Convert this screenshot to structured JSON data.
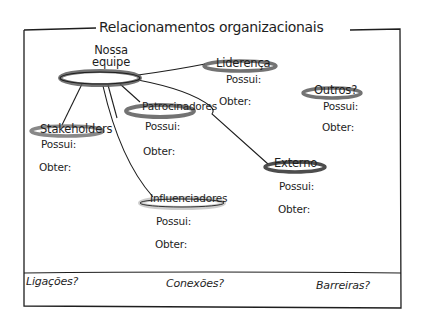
{
  "title": "Relacionamentos organizacionais",
  "center": {
    "label_line1": "Nossa",
    "label_line2": "equipe"
  },
  "nodes": [
    {
      "id": "lideranca",
      "label": "Liderença",
      "possui": "Possui:",
      "obter": "Obter:"
    },
    {
      "id": "outros",
      "label": "Outros?",
      "possui": "Possui:",
      "obter": "Obter:"
    },
    {
      "id": "patrocinadores",
      "label": "Patrocinadores",
      "possui": "Possui:",
      "obter": "Obter:"
    },
    {
      "id": "stakeholders",
      "label": "Stakeholders",
      "possui": "Possui:",
      "obter": "Obter:"
    },
    {
      "id": "externo",
      "label": "Externo",
      "possui": "Possui:",
      "obter": "Obter:"
    },
    {
      "id": "influenciadores",
      "label": "Influenciadores",
      "possui": "Possui:",
      "obter": "Obter:"
    }
  ],
  "footer": {
    "left": "Ligações?",
    "center": "Conexões?",
    "right": "Barreiras?"
  },
  "colors": {
    "ink": "#1e1e1e",
    "ellipse_shadow": "#6a6a6a",
    "light_shadow": "#c8c8c8"
  }
}
